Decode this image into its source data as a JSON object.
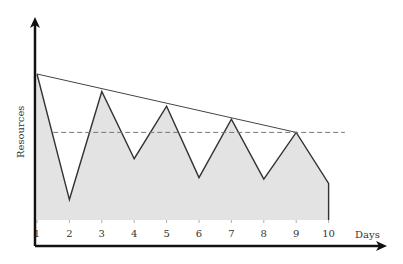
{
  "chart_data": {
    "type": "area",
    "title": "",
    "xlabel": "Days",
    "ylabel": "Resources",
    "categories": [
      "1",
      "2",
      "3",
      "4",
      "5",
      "6",
      "7",
      "8",
      "9",
      "10"
    ],
    "x": [
      1,
      2,
      3,
      4,
      5,
      6,
      7,
      8,
      9,
      10
    ],
    "series": [
      {
        "name": "Resources",
        "values": [
          10.0,
          1.4,
          8.8,
          4.2,
          7.8,
          2.9,
          6.9,
          2.8,
          6.0,
          2.5
        ]
      }
    ],
    "annotations": [
      {
        "type": "trend-line",
        "from": {
          "x": 1,
          "y": 10.0
        },
        "to": {
          "x": 9,
          "y": 6.0
        },
        "style": "solid"
      },
      {
        "type": "horizontal-line",
        "y": 6.0,
        "style": "dashed",
        "x_range": [
          1.5,
          10.5
        ]
      }
    ],
    "ylim": [
      0,
      11
    ],
    "grid": false,
    "legend": "none",
    "y_ticks_shown": false,
    "colors": {
      "fill": "#e3e3e3",
      "line": "#333333",
      "trend_line": "#444444",
      "dashed_line": "#777777",
      "axis": "#111111"
    }
  },
  "axes": {
    "x_title": "Days",
    "y_title": "Resources",
    "x_ticks": [
      "1",
      "2",
      "3",
      "4",
      "5",
      "6",
      "7",
      "8",
      "9",
      "10"
    ]
  }
}
